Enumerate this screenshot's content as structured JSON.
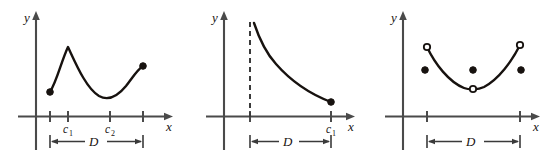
{
  "figure": {
    "title": "",
    "background_color": "#ffffff",
    "stroke_color": "#17120f",
    "axis_color": "#4a4a4a",
    "panel_count": 3
  },
  "labels": {
    "y_axis": "y",
    "x_axis": "x",
    "c": "c",
    "sub_1": "1",
    "sub_2": "2",
    "interval": "D"
  },
  "chart_data": [
    {
      "type": "line",
      "panel": "left",
      "title": "",
      "xlabel": "x",
      "ylabel": "y",
      "grid": false,
      "legend": null,
      "xlim": [
        0,
        180
      ],
      "ylim": [
        0,
        130
      ],
      "annotations": [
        "c1",
        "c2",
        "D"
      ],
      "tick_labels": [
        "",
        "c1",
        "c2",
        ""
      ],
      "tick_x": [
        50,
        68,
        110,
        143
      ],
      "interval_label": "D",
      "interval_span": [
        50,
        143
      ],
      "endpoints": [
        {
          "x": 50,
          "y": 92,
          "style": "filled"
        },
        {
          "x": 143,
          "y": 66,
          "style": "filled"
        }
      ],
      "critical_points": [
        {
          "label": "c1",
          "x": 68,
          "y": 47,
          "kind": "local-maximum"
        },
        {
          "label": "c2",
          "x": 110,
          "y": 98,
          "kind": "local-minimum"
        }
      ],
      "curve_path": "M 50,92 C 57,81 61,62 68,47 C 76,64 86,88 99,96 C 108,101 117,97 126,86 C 133,77 137,70 143,66"
    },
    {
      "type": "line",
      "panel": "middle",
      "title": "",
      "xlabel": "x",
      "ylabel": "y",
      "grid": false,
      "legend": null,
      "xlim": [
        185,
        370
      ],
      "ylim": [
        0,
        130
      ],
      "annotations": [
        "asymptote",
        "c1",
        "D"
      ],
      "tick_labels": [
        "",
        "c1"
      ],
      "tick_x": [
        250,
        331
      ],
      "interval_label": "D",
      "interval_span": [
        250,
        331
      ],
      "asymptote": {
        "x": 250,
        "y_top": 22,
        "y_bottom": 117,
        "style": "dashed"
      },
      "endpoints": [
        {
          "x": 331,
          "y": 102,
          "style": "filled"
        }
      ],
      "critical_points": [
        {
          "label": "c1",
          "x": 331,
          "y": 102,
          "kind": "endpoint-minimum"
        }
      ],
      "curve_path": "M 254,23 C 259,38 265,52 276,64 C 290,80 310,94 331,102"
    },
    {
      "type": "scatter-line",
      "panel": "right",
      "title": "",
      "xlabel": "x",
      "ylabel": "y",
      "grid": false,
      "legend": null,
      "xlim": [
        370,
        559
      ],
      "ylim": [
        0,
        130
      ],
      "annotations": [
        "D"
      ],
      "tick_labels": [
        "",
        ""
      ],
      "tick_x": [
        427,
        520
      ],
      "interval_label": "D",
      "interval_span": [
        427,
        520
      ],
      "open_points": [
        {
          "x": 427,
          "y": 47
        },
        {
          "x": 473,
          "y": 89
        },
        {
          "x": 520,
          "y": 45
        }
      ],
      "filled_points": [
        {
          "x": 425,
          "y": 70
        },
        {
          "x": 473,
          "y": 70
        },
        {
          "x": 521,
          "y": 70
        }
      ],
      "curve_path": "M 427,47 C 435,64 449,82 464,88 C 469,90 478,90 484,87 C 499,79 512,61 520,45"
    }
  ]
}
